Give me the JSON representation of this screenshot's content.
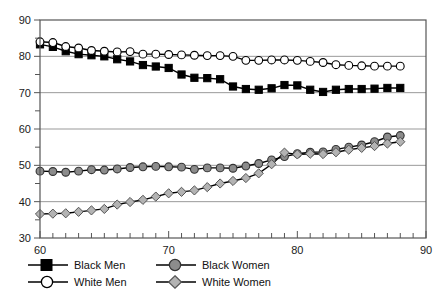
{
  "chart_data": {
    "type": "line",
    "title": "",
    "xlabel": "",
    "ylabel": "",
    "xlim": [
      60,
      90
    ],
    "ylim": [
      30,
      90
    ],
    "x_ticks": [
      60,
      70,
      80,
      90
    ],
    "y_ticks": [
      30,
      40,
      50,
      60,
      70,
      80,
      90
    ],
    "x_minor_tick_step": 1,
    "y_minor_tick_step": 5,
    "grid": "horizontal-major",
    "legend_position": "bottom-left",
    "x": [
      60,
      61,
      62,
      63,
      64,
      65,
      66,
      67,
      68,
      69,
      70,
      71,
      72,
      73,
      74,
      75,
      76,
      77,
      78,
      79,
      80,
      81,
      82,
      83,
      84,
      85,
      86,
      87,
      88
    ],
    "series": [
      {
        "name": "Black Men",
        "marker": "square",
        "marker_fill": "#000000",
        "marker_edge": "#000000",
        "line_color": "#000000",
        "values": [
          83.3,
          82.6,
          81.4,
          80.6,
          80.3,
          80.0,
          79.2,
          78.6,
          77.6,
          77.2,
          76.8,
          75.0,
          74.1,
          74.0,
          73.7,
          71.7,
          71.0,
          70.8,
          71.2,
          72.1,
          72.0,
          70.8,
          70.2,
          70.8,
          71.0,
          71.0,
          71.1,
          71.3,
          71.3
        ]
      },
      {
        "name": "White Men",
        "marker": "circle",
        "marker_fill": "#ffffff",
        "marker_edge": "#000000",
        "line_color": "#000000",
        "values": [
          84.0,
          83.8,
          82.7,
          82.3,
          81.6,
          81.4,
          81.2,
          81.3,
          80.6,
          80.6,
          80.5,
          80.4,
          80.3,
          80.2,
          80.2,
          80.0,
          78.9,
          78.9,
          79.0,
          79.0,
          78.9,
          78.6,
          78.3,
          77.7,
          77.5,
          77.4,
          77.3,
          77.3,
          77.3
        ]
      },
      {
        "name": "Black Women",
        "marker": "circle",
        "marker_fill": "#8c8c8c",
        "marker_edge": "#333333",
        "line_color": "#000000",
        "values": [
          48.4,
          48.3,
          48.1,
          48.4,
          48.8,
          48.7,
          49.0,
          49.4,
          49.6,
          49.7,
          49.6,
          49.5,
          48.9,
          49.3,
          49.3,
          49.2,
          49.8,
          50.5,
          51.5,
          52.4,
          53.2,
          53.6,
          53.7,
          54.4,
          55.0,
          55.6,
          56.5,
          57.8,
          58.2
        ]
      },
      {
        "name": "White Women",
        "marker": "diamond",
        "marker_fill": "#b3b3b3",
        "marker_edge": "#555555",
        "line_color": "#000000",
        "values": [
          36.6,
          36.7,
          36.8,
          37.2,
          37.6,
          38.0,
          39.2,
          39.9,
          40.5,
          41.4,
          42.3,
          42.7,
          43.1,
          44.0,
          45.0,
          45.7,
          46.5,
          47.8,
          50.3,
          53.5,
          53.0,
          53.2,
          53.1,
          53.6,
          54.3,
          54.8,
          55.3,
          56.0,
          56.5
        ]
      }
    ]
  },
  "legend": {
    "items": [
      {
        "label": "Black Men",
        "marker": "square"
      },
      {
        "label": "Black Women",
        "marker": "circle-gray"
      },
      {
        "label": "White Men",
        "marker": "circle-open"
      },
      {
        "label": "White Women",
        "marker": "diamond-gray"
      }
    ]
  },
  "colors": {
    "axis": "#555555",
    "grid": "#999999",
    "black_series": "#000000",
    "gray_circle": "#8c8c8c",
    "gray_diamond": "#b3b3b3",
    "text": "#1a1a1a"
  }
}
